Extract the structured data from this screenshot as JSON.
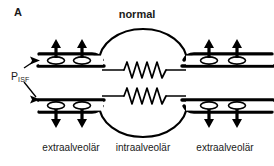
{
  "figure": {
    "panel_letter": "A",
    "title": "normal",
    "pressure_label": {
      "base": "P",
      "subscript": "ISF"
    },
    "region_labels": {
      "left": "extraalveolär",
      "middle": "intraalveolär",
      "right": "extraalveolär"
    },
    "colors": {
      "ink": "#000000",
      "background": "#ffffff",
      "vessel_lumen": "#ffffff"
    },
    "elements": {
      "alveolus": "alveolus-circle",
      "capillary": "spring-zigzag-capillary",
      "vessel": "extraalveolar-vessel",
      "pressure_arrows": "interstitial-pressure-arrows",
      "pointer_arrows": "pisf-pointer-arrows"
    },
    "counts": {
      "alveoli": 2,
      "capillary_springs": 2,
      "pressure_arrows": 8,
      "vessel_lumen_ellipses": 8,
      "pointer_arrows": 2
    }
  }
}
